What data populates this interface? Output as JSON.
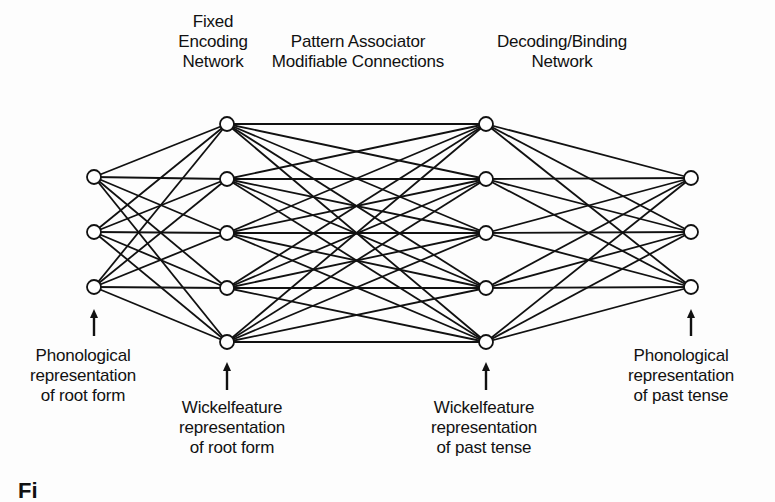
{
  "diagram": {
    "header_labels": [
      {
        "id": "fixed-encoding",
        "lines": [
          "Fixed",
          "Encoding",
          "Network"
        ],
        "x": 213,
        "y": 12
      },
      {
        "id": "pattern-associator",
        "lines": [
          "Pattern Associator",
          "Modifiable Connections"
        ],
        "x": 358,
        "y": 32
      },
      {
        "id": "decoding-binding",
        "lines": [
          "Decoding/Binding",
          "Network"
        ],
        "x": 562,
        "y": 32
      }
    ],
    "footer_labels": [
      {
        "id": "phon-root",
        "lines": [
          "Phonological",
          "representation",
          "of root form"
        ],
        "x": 83,
        "y": 346
      },
      {
        "id": "wf-root",
        "lines": [
          "Wickelfeature",
          "representation",
          "of root form"
        ],
        "x": 232,
        "y": 398
      },
      {
        "id": "wf-past",
        "lines": [
          "Wickelfeature",
          "representation",
          "of past tense"
        ],
        "x": 484,
        "y": 398
      },
      {
        "id": "phon-past",
        "lines": [
          "Phonological",
          "representation",
          "of past tense"
        ],
        "x": 681,
        "y": 346
      }
    ],
    "layers": [
      {
        "name": "phonological-root",
        "x": 94,
        "ys": [
          177,
          232,
          287
        ]
      },
      {
        "name": "wickelfeature-root",
        "x": 227,
        "ys": [
          124,
          179,
          233,
          288,
          342
        ]
      },
      {
        "name": "wickelfeature-past",
        "x": 486,
        "ys": [
          124,
          179,
          233,
          288,
          342
        ]
      },
      {
        "name": "phonological-past",
        "x": 691,
        "ys": [
          178,
          232,
          287
        ]
      }
    ],
    "arrows": [
      {
        "x": 94,
        "y_top": 309,
        "y_bottom": 336
      },
      {
        "x": 227,
        "y_top": 362,
        "y_bottom": 390
      },
      {
        "x": 486,
        "y_top": 362,
        "y_bottom": 390
      },
      {
        "x": 691,
        "y_top": 309,
        "y_bottom": 336
      }
    ],
    "node_radius": 7,
    "line_color": "#111111",
    "node_fill": "#ffffff",
    "partial_caption": "Fi"
  }
}
